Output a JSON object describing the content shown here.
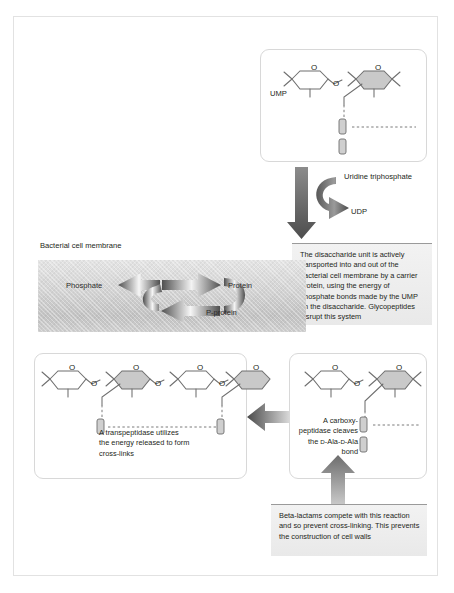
{
  "figure": {
    "membrane_label": "Bacterial cell membrane"
  },
  "top_panel": {
    "name": "UMP-disaccharide panel",
    "ump_label": "UMP",
    "ring_oxygen": "O",
    "link_oxygen": "O"
  },
  "transfer_step": {
    "input_label": "Uridine triphosphate",
    "output_label": "UDP"
  },
  "transport_note": {
    "text": "The disaccharide unit is actively transported into and out of the bacterial cell membrane by a carrier protein, using the energy of phosphate bonds made by the UMP on the disaccharide. Glycopeptides disrupt this system"
  },
  "membrane_cycle": {
    "phosphate_label": "Phosphate",
    "protein_label": "Protein",
    "p_protein_label": "P-protein"
  },
  "transpeptidase_panel": {
    "caption_line1": "A transpeptidase utilizes",
    "caption_line2": "the energy released to form",
    "caption_line3": "cross-links",
    "ring_oxygen": "O",
    "link_oxygen": "O"
  },
  "carboxypeptidase_panel": {
    "caption_line1": "A carboxy-",
    "caption_line2": "peptidase cleaves",
    "caption_line3_a": "the ",
    "caption_line3_d1": "D",
    "caption_line3_b": "-Ala-",
    "caption_line3_d2": "D",
    "caption_line3_c": "-Ala",
    "caption_line4": "bond",
    "ring_oxygen": "O",
    "link_oxygen": "O"
  },
  "betalactam_note": {
    "text": "Beta-lactams compete with this reaction and so prevent cross-linking. This prevents the construction of cell walls"
  },
  "colors": {
    "frame_border": "#e2e2e2",
    "panel_border": "#d8d8d8",
    "arrow_dark": "#5a5a5a",
    "arrow_light": "#d9d9d9",
    "sugar_shaded": "#c9c9c9",
    "note_background": "#eeeeee",
    "text": "#231f20"
  }
}
